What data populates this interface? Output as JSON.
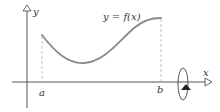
{
  "figure": {
    "labels": {
      "y_axis": "y",
      "x_axis": "x",
      "curve": "y = f(x)",
      "a": "a",
      "b": "b"
    },
    "colors": {
      "axis": "#555555",
      "curve": "#8a8a8a",
      "dashed": "#bbbbbb",
      "text": "#333333",
      "rotation_marker": "#222222"
    }
  }
}
